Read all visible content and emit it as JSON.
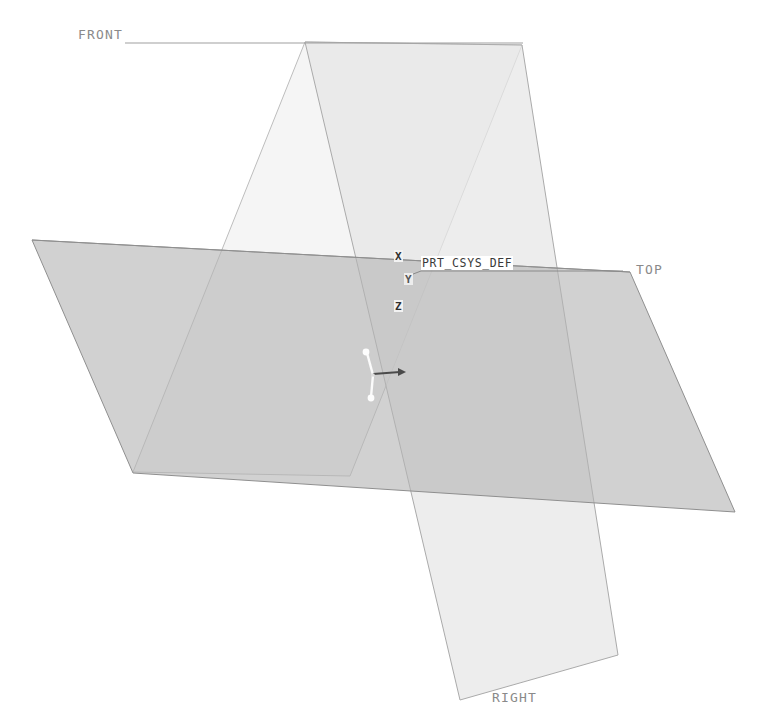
{
  "scene": {
    "title": "Datum planes and default coordinate system",
    "background_color": "#ffffff",
    "planes": [
      {
        "id": "front",
        "label": "FRONT",
        "label_x": 78,
        "label_y": 27,
        "underline_from_x": 125,
        "underline_to_x": 523,
        "underline_y": 43,
        "fill": "#f4f4f4",
        "stroke": "#b9b9b9",
        "points": "133,472 305,42 522,45 350,476"
      },
      {
        "id": "top",
        "label": "TOP",
        "label_x": 636,
        "label_y": 262,
        "fill": "#c9c9c9",
        "stroke": "#9a9a9a",
        "points": "32,240 630,272 735,512 133,473"
      },
      {
        "id": "right",
        "label": "RIGHT",
        "label_x": 492,
        "label_y": 690,
        "fill": "#e3e3e3",
        "stroke": "#a8a8a8",
        "points": "305,42 460,700 618,655 522,45"
      }
    ],
    "csys": {
      "name": "PRT_CSYS_DEF",
      "name_x": 421,
      "name_y": 256,
      "origin_x": 373,
      "origin_y": 375,
      "underline_from_x": 421,
      "underline_to_x": 623,
      "underline_y": 271,
      "axes": [
        {
          "name": "X",
          "letter": "X",
          "label_x": 394,
          "label_y": 250,
          "to_x": 404,
          "to_y": 371,
          "color": "#e8e8e8"
        },
        {
          "name": "Y",
          "letter": "Y",
          "label_x": 404,
          "label_y": 273,
          "to_x": 367,
          "to_y": 353,
          "color": "#f5f5f5"
        },
        {
          "name": "Z",
          "letter": "Z",
          "label_x": 394,
          "label_y": 300,
          "to_x": 371,
          "to_y": 397,
          "color": "#f5f5f5"
        }
      ],
      "arrow_label": "x-arrow"
    }
  }
}
